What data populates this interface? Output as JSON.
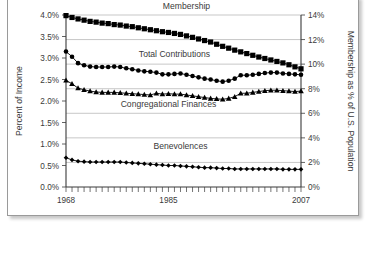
{
  "chart_data": {
    "type": "line",
    "title": "",
    "xlabel": "",
    "ylabel": "Percent of Income",
    "y2label": "Membership as % of U.S. Population",
    "xlim": [
      1968,
      2007
    ],
    "ylim": [
      0.0,
      4.0
    ],
    "y2lim": [
      0,
      14
    ],
    "grid": true,
    "legend_position": "inline-labels",
    "x": [
      1968,
      1969,
      1970,
      1971,
      1972,
      1973,
      1974,
      1975,
      1976,
      1977,
      1978,
      1979,
      1980,
      1981,
      1982,
      1983,
      1984,
      1985,
      1986,
      1987,
      1988,
      1989,
      1990,
      1991,
      1992,
      1993,
      1994,
      1995,
      1996,
      1997,
      1998,
      1999,
      2000,
      2001,
      2002,
      2003,
      2004,
      2005,
      2006,
      2007
    ],
    "xticks": [
      1968,
      1985,
      2007
    ],
    "xtick_labels": [
      "1968",
      "1985",
      "2007"
    ],
    "yticks": [
      0.0,
      0.5,
      1.0,
      1.5,
      2.0,
      2.5,
      3.0,
      3.5,
      4.0
    ],
    "ytick_labels": [
      "0.0%",
      "0.5%",
      "1.0%",
      "1.5%",
      "2.0%",
      "2.5%",
      "3.0%",
      "3.5%",
      "4.0%"
    ],
    "y2ticks": [
      0,
      2,
      4,
      6,
      8,
      10,
      12,
      14
    ],
    "y2tick_labels": [
      "0%",
      "2%",
      "4%",
      "6%",
      "8%",
      "10%",
      "12%",
      "14%"
    ],
    "gridline_values": [
      2,
      4,
      6,
      8,
      10,
      12,
      14
    ],
    "series": [
      {
        "name": "Membership",
        "axis": "right",
        "marker": "square",
        "unit": "percent of U.S. population",
        "label_x": 1988,
        "label_y_axis_right": 14.45,
        "values": [
          13.95,
          13.8,
          13.68,
          13.58,
          13.48,
          13.42,
          13.34,
          13.3,
          13.22,
          13.18,
          13.1,
          13.05,
          12.96,
          12.88,
          12.8,
          12.72,
          12.64,
          12.58,
          12.5,
          12.42,
          12.3,
          12.18,
          12.05,
          11.92,
          11.8,
          11.62,
          11.45,
          11.3,
          11.14,
          11.0,
          10.86,
          10.72,
          10.58,
          10.46,
          10.34,
          10.22,
          10.1,
          9.95,
          9.78,
          9.62
        ]
      },
      {
        "name": "Total Contributions",
        "axis": "left",
        "marker": "circle",
        "unit": "percent of income",
        "label_x": 1986,
        "label_y_axis_left": 3.03,
        "values": [
          3.15,
          3.03,
          2.88,
          2.83,
          2.8,
          2.79,
          2.79,
          2.79,
          2.8,
          2.79,
          2.76,
          2.74,
          2.71,
          2.69,
          2.68,
          2.66,
          2.62,
          2.62,
          2.63,
          2.64,
          2.61,
          2.58,
          2.55,
          2.52,
          2.5,
          2.47,
          2.45,
          2.47,
          2.52,
          2.6,
          2.6,
          2.61,
          2.63,
          2.65,
          2.66,
          2.66,
          2.64,
          2.63,
          2.62,
          2.61
        ]
      },
      {
        "name": "Congregational Finances",
        "axis": "left",
        "marker": "triangle",
        "unit": "percent of income",
        "label_x": 1985,
        "label_y_axis_left": 1.86,
        "values": [
          2.48,
          2.4,
          2.3,
          2.26,
          2.23,
          2.21,
          2.2,
          2.2,
          2.2,
          2.19,
          2.18,
          2.17,
          2.16,
          2.15,
          2.14,
          2.18,
          2.16,
          2.17,
          2.16,
          2.16,
          2.14,
          2.12,
          2.1,
          2.08,
          2.06,
          2.05,
          2.04,
          2.06,
          2.1,
          2.18,
          2.18,
          2.2,
          2.22,
          2.24,
          2.25,
          2.25,
          2.24,
          2.23,
          2.22,
          2.23
        ]
      },
      {
        "name": "Benevolences",
        "axis": "left",
        "marker": "diamond",
        "unit": "percent of income",
        "label_x": 1987,
        "label_y_axis_left": 0.88,
        "values": [
          0.68,
          0.63,
          0.6,
          0.59,
          0.58,
          0.58,
          0.58,
          0.58,
          0.58,
          0.58,
          0.57,
          0.56,
          0.55,
          0.54,
          0.53,
          0.52,
          0.51,
          0.5,
          0.5,
          0.49,
          0.48,
          0.47,
          0.46,
          0.45,
          0.45,
          0.44,
          0.43,
          0.43,
          0.42,
          0.42,
          0.42,
          0.42,
          0.42,
          0.42,
          0.42,
          0.42,
          0.41,
          0.41,
          0.41,
          0.41
        ]
      }
    ]
  }
}
